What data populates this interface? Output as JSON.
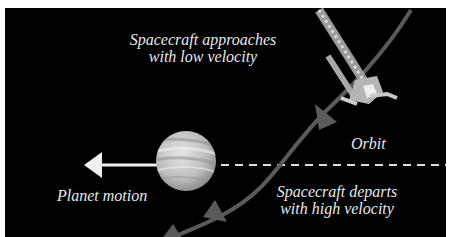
{
  "diagram": {
    "labels": {
      "approach_line1": "Spacecraft approaches",
      "approach_line2": "with low velocity",
      "orbit": "Orbit",
      "planet_motion": "Planet motion",
      "depart_line1": "Spacecraft departs",
      "depart_line2": "with high velocity"
    },
    "elements": {
      "planet": "banded gas-giant planet",
      "spacecraft": "spacecraft with boom antennas",
      "planet_motion_arrow": "white arrow pointing left",
      "orbit_reference": "dashed horizontal line",
      "trajectory": "curved spacecraft path with direction arrowheads"
    },
    "colors": {
      "background": "#000000",
      "text": "#e8e8e8",
      "trajectory": "#5a5a5a",
      "planet": "#c8c8c8",
      "arrow": "#f0f0f0",
      "dashed_line": "#dcdcdc"
    }
  }
}
